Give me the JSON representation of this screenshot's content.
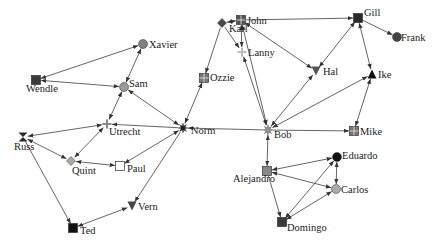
{
  "diagram": {
    "type": "directed-network",
    "nodes": [
      {
        "id": "Xavier",
        "label": "Xavier",
        "x": 143,
        "y": 44,
        "shape": "circle",
        "color": "#808080",
        "lx": 6,
        "ly": 4
      },
      {
        "id": "Wendle",
        "label": "Wendle",
        "x": 36,
        "y": 80,
        "shape": "square",
        "color": "#3a3a3a",
        "lx": -10,
        "ly": 12
      },
      {
        "id": "Sam",
        "label": "Sam",
        "x": 124,
        "y": 87,
        "shape": "circle",
        "color": "#9a9a9a",
        "lx": 5,
        "ly": 0
      },
      {
        "id": "Utrecht",
        "label": "Utrecht",
        "x": 107,
        "y": 124,
        "shape": "cross",
        "color": "#8a8a8a",
        "lx": 2,
        "ly": 11
      },
      {
        "id": "Russ",
        "label": "Russ",
        "x": 23,
        "y": 137,
        "shape": "bowtie",
        "color": "#2a2a2a",
        "lx": -9,
        "ly": 13
      },
      {
        "id": "Quint",
        "label": "Quint",
        "x": 71,
        "y": 161,
        "shape": "diamond",
        "color": "#aaaaaa",
        "lx": 1,
        "ly": 13
      },
      {
        "id": "Paul",
        "label": "Paul",
        "x": 120,
        "y": 166,
        "shape": "square-open",
        "color": "#ffffff",
        "lx": 7,
        "ly": 6
      },
      {
        "id": "Norm",
        "label": "Norm",
        "x": 183,
        "y": 128,
        "shape": "star",
        "color": "#222222",
        "lx": 8,
        "ly": 6
      },
      {
        "id": "Ozzie",
        "label": "Ozzie",
        "x": 204,
        "y": 78,
        "shape": "square-grid",
        "color": "#777777",
        "lx": 6,
        "ly": 3
      },
      {
        "id": "Karl",
        "label": "Karl",
        "x": 222,
        "y": 23,
        "shape": "diamond",
        "color": "#4a4a4a",
        "lx": 7,
        "ly": 9
      },
      {
        "id": "John",
        "label": "John",
        "x": 241,
        "y": 20,
        "shape": "square-grid",
        "color": "#555555",
        "lx": 6,
        "ly": 4
      },
      {
        "id": "Lanny",
        "label": "Lanny",
        "x": 242,
        "y": 52,
        "shape": "cross",
        "color": "#bbbbbb",
        "lx": 6,
        "ly": 4
      },
      {
        "id": "Hal",
        "label": "Hal",
        "x": 316,
        "y": 71,
        "shape": "triangle-down",
        "color": "#555555",
        "lx": 7,
        "ly": 4
      },
      {
        "id": "Gill",
        "label": "Gill",
        "x": 358,
        "y": 18,
        "shape": "square",
        "color": "#2a2a2a",
        "lx": 6,
        "ly": -2
      },
      {
        "id": "Frank",
        "label": "Frank",
        "x": 397,
        "y": 37,
        "shape": "circle",
        "color": "#444444",
        "lx": 4,
        "ly": 4
      },
      {
        "id": "Ike",
        "label": "Ike",
        "x": 372,
        "y": 74,
        "shape": "triangle-up",
        "color": "#111111",
        "lx": 6,
        "ly": 4
      },
      {
        "id": "Bob",
        "label": "Bob",
        "x": 268,
        "y": 130,
        "shape": "star",
        "color": "#999999",
        "lx": 6,
        "ly": 8
      },
      {
        "id": "Mike",
        "label": "Mike",
        "x": 354,
        "y": 131,
        "shape": "square-grid",
        "color": "#777777",
        "lx": 6,
        "ly": 4
      },
      {
        "id": "Eduardo",
        "label": "Eduardo",
        "x": 337,
        "y": 157,
        "shape": "circle",
        "color": "#111111",
        "lx": 5,
        "ly": 2
      },
      {
        "id": "Alejandro",
        "label": "Alejandro",
        "x": 267,
        "y": 171,
        "shape": "square",
        "color": "#888888",
        "lx": -34,
        "ly": 11
      },
      {
        "id": "Carlos",
        "label": "Carlos",
        "x": 336,
        "y": 189,
        "shape": "circle",
        "color": "#aaaaaa",
        "lx": 5,
        "ly": 4
      },
      {
        "id": "Domingo",
        "label": "Domingo",
        "x": 282,
        "y": 222,
        "shape": "square",
        "color": "#3a3a3a",
        "lx": 5,
        "ly": 9
      },
      {
        "id": "Vern",
        "label": "Vern",
        "x": 132,
        "y": 206,
        "shape": "triangle-down",
        "color": "#444444",
        "lx": 6,
        "ly": 4
      },
      {
        "id": "Ted",
        "label": "Ted",
        "x": 73,
        "y": 228,
        "shape": "square",
        "color": "#111111",
        "lx": 7,
        "ly": 6
      }
    ],
    "edges": [
      {
        "from": "Wendle",
        "to": "Xavier",
        "dir": "both"
      },
      {
        "from": "Wendle",
        "to": "Sam",
        "dir": "both"
      },
      {
        "from": "Sam",
        "to": "Xavier",
        "dir": "both"
      },
      {
        "from": "Sam",
        "to": "Utrecht",
        "dir": "both"
      },
      {
        "from": "Norm",
        "to": "Sam",
        "dir": "both"
      },
      {
        "from": "Norm",
        "to": "Utrecht",
        "dir": "forward"
      },
      {
        "from": "Russ",
        "to": "Utrecht",
        "dir": "both"
      },
      {
        "from": "Russ",
        "to": "Quint",
        "dir": "both"
      },
      {
        "from": "Utrecht",
        "to": "Quint",
        "dir": "both"
      },
      {
        "from": "Quint",
        "to": "Paul",
        "dir": "both"
      },
      {
        "from": "Norm",
        "to": "Paul",
        "dir": "both"
      },
      {
        "from": "Russ",
        "to": "Ted",
        "dir": "forward"
      },
      {
        "from": "Ted",
        "to": "Vern",
        "dir": "both"
      },
      {
        "from": "Norm",
        "to": "Vern",
        "dir": "forward"
      },
      {
        "from": "Norm",
        "to": "Ozzie",
        "dir": "both"
      },
      {
        "from": "Karl",
        "to": "Ozzie",
        "dir": "forward"
      },
      {
        "from": "Bob",
        "to": "Norm",
        "dir": "forward"
      },
      {
        "from": "John",
        "to": "Karl",
        "dir": "both"
      },
      {
        "from": "Karl",
        "to": "Lanny",
        "dir": "forward"
      },
      {
        "from": "John",
        "to": "Lanny",
        "dir": "both"
      },
      {
        "from": "Bob",
        "to": "Lanny",
        "dir": "both"
      },
      {
        "from": "Bob",
        "to": "John",
        "dir": "both"
      },
      {
        "from": "John",
        "to": "Gill",
        "dir": "forward"
      },
      {
        "from": "John",
        "to": "Hal",
        "dir": "both"
      },
      {
        "from": "Gill",
        "to": "Hal",
        "dir": "both"
      },
      {
        "from": "Gill",
        "to": "Frank",
        "dir": "forward"
      },
      {
        "from": "Gill",
        "to": "Ike",
        "dir": "both"
      },
      {
        "from": "Bob",
        "to": "Hal",
        "dir": "both"
      },
      {
        "from": "Bob",
        "to": "Ike",
        "dir": "both"
      },
      {
        "from": "Bob",
        "to": "Mike",
        "dir": "forward"
      },
      {
        "from": "Ike",
        "to": "Mike",
        "dir": "both"
      },
      {
        "from": "Bob",
        "to": "Alejandro",
        "dir": "both"
      },
      {
        "from": "Alejandro",
        "to": "Eduardo",
        "dir": "both"
      },
      {
        "from": "Alejandro",
        "to": "Carlos",
        "dir": "both"
      },
      {
        "from": "Alejandro",
        "to": "Domingo",
        "dir": "forward"
      },
      {
        "from": "Eduardo",
        "to": "Carlos",
        "dir": "both"
      },
      {
        "from": "Domingo",
        "to": "Eduardo",
        "dir": "both"
      },
      {
        "from": "Domingo",
        "to": "Carlos",
        "dir": "both"
      }
    ]
  }
}
